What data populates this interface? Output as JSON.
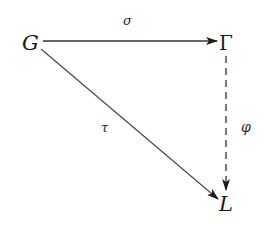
{
  "diagram": {
    "type": "commutative-triangle",
    "nodes": [
      {
        "id": "G",
        "label": "G",
        "x": 31,
        "y": 48
      },
      {
        "id": "Gamma",
        "label": "Γ",
        "x": 226,
        "y": 48
      },
      {
        "id": "L",
        "label": "L",
        "x": 228,
        "y": 209
      }
    ],
    "edges": [
      {
        "from": "G",
        "to": "Gamma",
        "label": "σ",
        "style": "solid"
      },
      {
        "from": "G",
        "to": "L",
        "label": "τ",
        "style": "solid"
      },
      {
        "from": "Gamma",
        "to": "L",
        "label": "φ",
        "style": "dashed"
      }
    ],
    "colors": {
      "line": "#333333",
      "text": "#1a1a1a",
      "background": "#ffffff"
    }
  }
}
